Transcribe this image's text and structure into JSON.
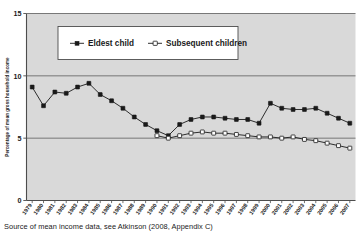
{
  "figure": {
    "caption": "Source of mean income data, see Atkinson (2008, Appendix C)",
    "ylabel": "Percentage of mean gross household income",
    "legend": {
      "eldest_label": "Eldest child",
      "subsequent_label": "Subsequent children"
    },
    "ytick_labels": [
      "0",
      "5",
      "10",
      "15"
    ],
    "colors": {
      "plot_background": "#d9d9d9",
      "line": "#1a1a1a",
      "marker_fill_eldest": "#1a1a1a",
      "marker_fill_subsequent": "#ffffff",
      "gridline": "#6b6b6b",
      "axis": "#4d4d4d",
      "text": "#1a1a1a"
    }
  },
  "chart_data": {
    "type": "line",
    "title": "",
    "subtitle": "",
    "xlabel": "",
    "ylabel": "Percentage of mean gross household income",
    "ylim": [
      0,
      15
    ],
    "yticks": [
      0,
      5,
      10,
      15
    ],
    "grid": true,
    "legend_position": "top-center",
    "annotations": [
      "Source of mean income data, see Atkinson (2008, Appendix C)"
    ],
    "categories": [
      "1979",
      "1980",
      "1981",
      "1982",
      "1983",
      "1984",
      "1985",
      "1986",
      "1987",
      "1988",
      "1989",
      "1990",
      "1991",
      "1992",
      "1993",
      "1994",
      "1995",
      "1996",
      "1997",
      "1998",
      "1999",
      "2000",
      "2001",
      "2002",
      "2003",
      "2004",
      "2005",
      "2006",
      "2007"
    ],
    "series": [
      {
        "name": "Eldest child",
        "marker": "filled-square",
        "values": [
          9.1,
          7.6,
          8.7,
          8.6,
          9.1,
          9.4,
          8.5,
          8.0,
          7.4,
          6.7,
          6.1,
          5.6,
          5.2,
          6.1,
          6.5,
          6.7,
          6.7,
          6.6,
          6.5,
          6.5,
          6.2,
          7.8,
          7.4,
          7.3,
          7.3,
          7.4,
          7.0,
          6.6,
          6.2
        ]
      },
      {
        "name": "Subsequent children",
        "marker": "open-square",
        "values": [
          null,
          null,
          null,
          null,
          null,
          null,
          null,
          null,
          null,
          null,
          null,
          5.2,
          5.0,
          5.2,
          5.4,
          5.5,
          5.4,
          5.4,
          5.3,
          5.2,
          5.1,
          5.1,
          5.0,
          5.1,
          4.9,
          4.8,
          4.6,
          4.4,
          4.2
        ]
      }
    ]
  }
}
